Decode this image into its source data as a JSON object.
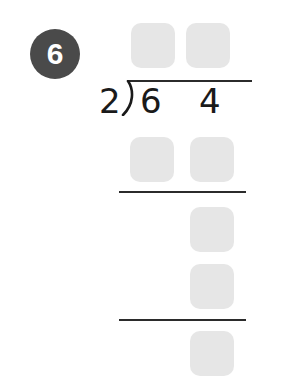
{
  "problem": {
    "number": "6",
    "divisor": "2",
    "dividend_digits": [
      "6",
      "4"
    ]
  },
  "answer_boxes": {
    "quotient": [
      {
        "id": "quotient-tens",
        "value": ""
      },
      {
        "id": "quotient-ones",
        "value": ""
      }
    ],
    "step1_product": [
      {
        "id": "product1-tens",
        "value": ""
      },
      {
        "id": "product1-ones",
        "value": ""
      }
    ],
    "step1_remainder_bringdown": {
      "id": "bringdown-ones",
      "value": ""
    },
    "step2_product": {
      "id": "product2-ones",
      "value": ""
    },
    "final_remainder": {
      "id": "remainder",
      "value": ""
    }
  },
  "colors": {
    "badge": "#4a4a4a",
    "box_fill": "#e6e6e6",
    "rule": "#2b2b2b",
    "text": "#1a1a1a"
  }
}
